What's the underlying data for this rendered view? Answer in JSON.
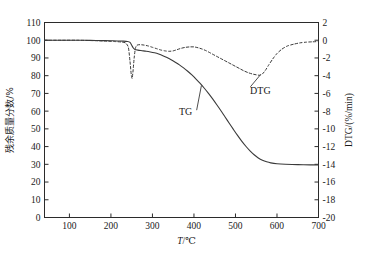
{
  "chart_data": {
    "type": "line",
    "title": "",
    "xlabel": "T/℃",
    "xlabel_symbol": "T",
    "xlabel_unit": "/℃",
    "ylabel_left": "残余质量分数/%",
    "ylabel_right": "DTG/(%/min)",
    "xlim": [
      40,
      700
    ],
    "xticks": [
      100,
      200,
      300,
      400,
      500,
      600,
      700
    ],
    "xticklabels": [
      "100",
      "200",
      "300",
      "400",
      "500",
      "600",
      "700"
    ],
    "ylim_left": [
      0,
      110
    ],
    "yticks_left": [
      0,
      10,
      20,
      30,
      40,
      50,
      60,
      70,
      80,
      90,
      100,
      110
    ],
    "yticklabels_left": [
      "0",
      "10",
      "20",
      "30",
      "40",
      "50",
      "60",
      "70",
      "80",
      "90",
      "100",
      "110"
    ],
    "ylim_right": [
      -20,
      2
    ],
    "yticks_right": [
      2,
      0,
      -2,
      -4,
      -6,
      -8,
      -10,
      -12,
      -14,
      -16,
      -18,
      -20
    ],
    "yticklabels_right": [
      "2",
      "0",
      "-2",
      "-4",
      "-6",
      "-8",
      "-10",
      "-12",
      "-14",
      "-16",
      "-18",
      "-20"
    ],
    "grid": false,
    "legend": "inline-annotations",
    "series": [
      {
        "name": "TG",
        "axis": "left",
        "style": "solid",
        "label_text": "TG",
        "points": [
          [
            40,
            100.0
          ],
          [
            60,
            100.0
          ],
          [
            90,
            100.0
          ],
          [
            120,
            100.0
          ],
          [
            150,
            99.9
          ],
          [
            180,
            99.8
          ],
          [
            200,
            99.7
          ],
          [
            215,
            99.6
          ],
          [
            230,
            99.5
          ],
          [
            240,
            99.3
          ],
          [
            246,
            98.8
          ],
          [
            250,
            97.2
          ],
          [
            254,
            95.6
          ],
          [
            258,
            94.8
          ],
          [
            265,
            94.4
          ],
          [
            275,
            94.1
          ],
          [
            285,
            93.8
          ],
          [
            295,
            93.4
          ],
          [
            305,
            92.9
          ],
          [
            315,
            92.2
          ],
          [
            325,
            91.3
          ],
          [
            335,
            90.2
          ],
          [
            345,
            89.0
          ],
          [
            355,
            87.6
          ],
          [
            365,
            86.1
          ],
          [
            375,
            84.4
          ],
          [
            385,
            82.5
          ],
          [
            395,
            80.4
          ],
          [
            405,
            78.1
          ],
          [
            415,
            75.6
          ],
          [
            425,
            72.9
          ],
          [
            435,
            70.0
          ],
          [
            445,
            66.9
          ],
          [
            455,
            63.6
          ],
          [
            465,
            60.2
          ],
          [
            475,
            56.7
          ],
          [
            485,
            53.2
          ],
          [
            495,
            49.7
          ],
          [
            505,
            46.3
          ],
          [
            515,
            43.1
          ],
          [
            525,
            40.2
          ],
          [
            535,
            37.6
          ],
          [
            545,
            35.4
          ],
          [
            555,
            33.6
          ],
          [
            565,
            32.3
          ],
          [
            575,
            31.4
          ],
          [
            585,
            30.8
          ],
          [
            600,
            30.3
          ],
          [
            620,
            30.0
          ],
          [
            650,
            29.8
          ],
          [
            680,
            29.7
          ],
          [
            700,
            29.6
          ]
        ]
      },
      {
        "name": "DTG",
        "axis": "right",
        "style": "dashed",
        "label_text": "DTG",
        "points": [
          [
            40,
            0.0
          ],
          [
            80,
            0.0
          ],
          [
            120,
            0.0
          ],
          [
            160,
            -0.05
          ],
          [
            190,
            -0.1
          ],
          [
            210,
            -0.15
          ],
          [
            225,
            -0.2
          ],
          [
            235,
            -0.3
          ],
          [
            242,
            -0.8
          ],
          [
            246,
            -2.4
          ],
          [
            249,
            -3.9
          ],
          [
            251,
            -4.3
          ],
          [
            253,
            -3.6
          ],
          [
            256,
            -2.0
          ],
          [
            259,
            -0.9
          ],
          [
            263,
            -0.55
          ],
          [
            270,
            -0.5
          ],
          [
            280,
            -0.55
          ],
          [
            290,
            -0.65
          ],
          [
            300,
            -0.8
          ],
          [
            310,
            -0.95
          ],
          [
            320,
            -1.1
          ],
          [
            330,
            -1.2
          ],
          [
            340,
            -1.25
          ],
          [
            350,
            -1.2
          ],
          [
            360,
            -1.05
          ],
          [
            370,
            -0.9
          ],
          [
            380,
            -0.8
          ],
          [
            390,
            -0.75
          ],
          [
            400,
            -0.75
          ],
          [
            410,
            -0.85
          ],
          [
            420,
            -1.0
          ],
          [
            430,
            -1.2
          ],
          [
            440,
            -1.45
          ],
          [
            450,
            -1.7
          ],
          [
            460,
            -1.95
          ],
          [
            470,
            -2.2
          ],
          [
            480,
            -2.45
          ],
          [
            490,
            -2.7
          ],
          [
            500,
            -2.95
          ],
          [
            510,
            -3.2
          ],
          [
            520,
            -3.45
          ],
          [
            530,
            -3.65
          ],
          [
            540,
            -3.8
          ],
          [
            550,
            -3.9
          ],
          [
            558,
            -3.95
          ],
          [
            565,
            -3.8
          ],
          [
            572,
            -3.4
          ],
          [
            580,
            -2.8
          ],
          [
            590,
            -2.1
          ],
          [
            600,
            -1.5
          ],
          [
            612,
            -1.0
          ],
          [
            625,
            -0.65
          ],
          [
            640,
            -0.45
          ],
          [
            655,
            -0.3
          ],
          [
            670,
            -0.22
          ],
          [
            685,
            -0.18
          ],
          [
            700,
            -0.15
          ]
        ]
      }
    ],
    "annotations": [
      {
        "text": "TG",
        "x": 380,
        "y": 58,
        "role": "series-label-tg"
      },
      {
        "text": "DTG",
        "x": 560,
        "y": -6.1,
        "role": "series-label-dtg"
      }
    ]
  },
  "axes": {
    "left_title": "残余质量分数/%",
    "right_title": "DTG/(%/min)",
    "bottom_title_symbol": "T",
    "bottom_title_rest": "/℃"
  }
}
